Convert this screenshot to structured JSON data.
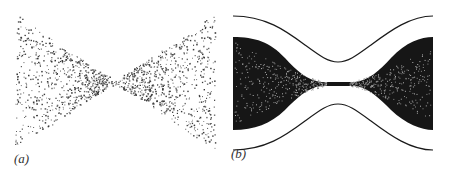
{
  "figure": {
    "panels": [
      {
        "id": "a",
        "label": "(a)",
        "description": "Scattered particle points forming a bowtie (hourglass) shape, converging to a waist at center"
      },
      {
        "id": "b",
        "label": "(b)",
        "description": "Dense filled bowtie distribution bounded by outer envelope curves that pinch toward the center"
      }
    ],
    "colors": {
      "ink": "#1a1a1a",
      "fill": "#161616",
      "background": "#ffffff"
    }
  }
}
